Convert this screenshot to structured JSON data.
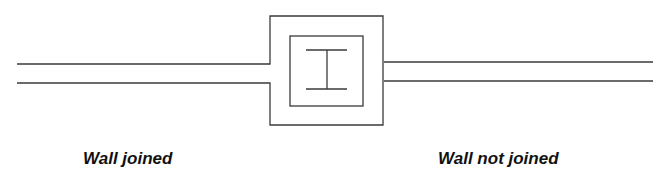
{
  "diagram": {
    "labels": {
      "left": "Wall joined",
      "right": "Wall not joined"
    },
    "elements": {
      "column": "Column with I-beam core",
      "left_wall": "Wall joined to column outline",
      "right_wall": "Wall abutting column, not joined"
    },
    "colors": {
      "stroke": "#3a3a3a",
      "text": "#111111",
      "background": "#ffffff"
    }
  }
}
